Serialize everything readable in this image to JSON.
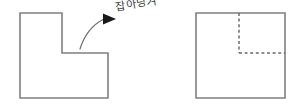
{
  "diagram": {
    "background_color": "#ffffff",
    "stroke_color": "#808080",
    "dashed_color": "#6b6b6b",
    "arrow_color": "#6e6e6e",
    "arrowhead_color": "#1a1a1a",
    "annotation": {
      "text": "잡아당겨",
      "meaning_label": "pull"
    },
    "left_figure": {
      "name": "L-shaped polygon (before)",
      "points": "20,13 62,13 62,53 108,53 108,98 20,98",
      "vertices": [
        [
          20,
          13
        ],
        [
          62,
          13
        ],
        [
          62,
          53
        ],
        [
          108,
          53
        ],
        [
          108,
          98
        ],
        [
          20,
          98
        ]
      ]
    },
    "right_figure": {
      "name": "Square polygon (after) with dashed fold lines",
      "outline": "196,13 285,13 285,98 196,98",
      "vertices": [
        [
          196,
          13
        ],
        [
          285,
          13
        ],
        [
          285,
          98
        ],
        [
          196,
          98
        ]
      ],
      "dashed_vertical": {
        "x": 239,
        "y1": 13,
        "y2": 53
      },
      "dashed_horizontal": {
        "y": 53,
        "x1": 239,
        "x2": 285
      }
    },
    "arrow": {
      "name": "curved pull arrow",
      "path": "M 80,49 C 84,36 92,25 104,19",
      "head_points": "103,13.5 116,19 103,24.5"
    }
  }
}
